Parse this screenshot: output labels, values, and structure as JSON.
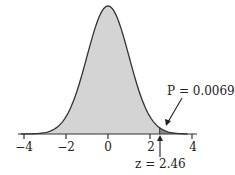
{
  "chart_data": {
    "type": "area",
    "title": "",
    "xlabel": "",
    "ylabel": "",
    "xlim": [
      -4,
      4
    ],
    "x_ticks": [
      -4,
      -2,
      0,
      2,
      4
    ],
    "tick_labels": [
      "−4",
      "−2",
      "0",
      "2",
      "4"
    ],
    "grid": false,
    "distribution": {
      "name": "standard normal",
      "mean": 0,
      "sd": 1
    },
    "shaded_region": {
      "from": 2.46,
      "to": 4,
      "area": 0.0069
    },
    "annotations": [
      {
        "text": "P = 0.0069",
        "points_to": "shaded upper tail"
      },
      {
        "text": "z = 2.46",
        "points_to": "z = 2.46 on axis"
      }
    ],
    "colors": {
      "body_fill": "#d4d4d4",
      "tail_fill": "#8a8a8a",
      "curve": "#333333"
    }
  },
  "labels": {
    "ticks": [
      "−4",
      "−2",
      "0",
      "2",
      "4"
    ],
    "p_label": "P = 0.0069",
    "z_label": "z = 2.46"
  }
}
